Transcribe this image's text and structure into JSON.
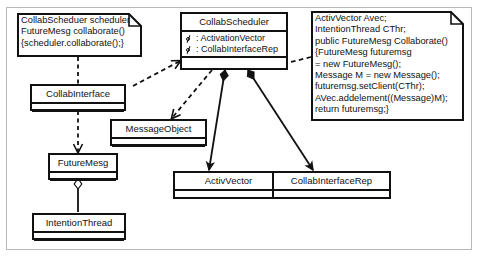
{
  "diagram": {
    "colors": {
      "line": "#111111",
      "frame": "#b9b9b9",
      "background": "#ffffff"
    },
    "notes": [
      {
        "id": "note-left",
        "lines": [
          "CollabScheduer scheduler",
          "FutureMesg collaborate()",
          "{scheduler.collaborate();}"
        ]
      },
      {
        "id": "note-right",
        "lines": [
          "ActivVector Avec;",
          "IntentionThread CThr;",
          "public FutureMesg Collaborate()",
          "{FutureMesg futuremsg",
          "= new FutureMesg();",
          "Message M = new Message();",
          "futuremsg.setClient(CThr);",
          "AVec.addelement((Message)M);",
          "return futuremsg;}"
        ]
      }
    ],
    "classes": [
      {
        "id": "collab-scheduler",
        "name": "CollabScheduler",
        "attributes": [
          ": ActivationVector",
          ": CollabInterfaceRep"
        ]
      },
      {
        "id": "collab-interface",
        "name": "CollabInterface",
        "attributes": []
      },
      {
        "id": "message-object",
        "name": "MessageObject",
        "attributes": []
      },
      {
        "id": "future-mesg",
        "name": "FutureMesg",
        "attributes": []
      },
      {
        "id": "activ-vector",
        "name": "ActivVector",
        "attributes": []
      },
      {
        "id": "collab-interface-rep",
        "name": "CollabInterfaceRep",
        "attributes": []
      },
      {
        "id": "intention-thread",
        "name": "IntentionThread",
        "attributes": []
      }
    ],
    "connectors": [
      {
        "id": "note-left-to-collab-interface",
        "kind": "dashed-anchor"
      },
      {
        "id": "collab-interface-to-future-mesg",
        "kind": "dashed-arrow"
      },
      {
        "id": "collab-interface-to-collab-scheduler",
        "kind": "dashed-arrow"
      },
      {
        "id": "collab-scheduler-to-message-object",
        "kind": "dashed-arrow"
      },
      {
        "id": "note-right-to-collab-scheduler",
        "kind": "dashed-anchor"
      },
      {
        "id": "collab-scheduler-to-activ-vector",
        "kind": "composition-arrow"
      },
      {
        "id": "collab-scheduler-to-collab-interface-rep",
        "kind": "composition-arrow"
      },
      {
        "id": "future-mesg-to-intention-thread",
        "kind": "aggregation"
      }
    ]
  }
}
